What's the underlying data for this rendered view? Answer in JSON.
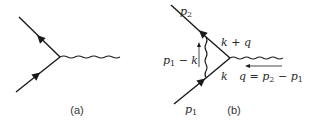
{
  "figure": {
    "panel_a": {
      "caption": "(a)",
      "description": "Tree-level vertex: incoming fermion, outgoing fermion, photon (wavy line)"
    },
    "panel_b": {
      "caption": "(b)",
      "labels": {
        "p2": {
          "base": "p",
          "sub": "2"
        },
        "p1": {
          "base": "p",
          "sub": "1"
        },
        "k_plus_q": "k + q",
        "k": "k",
        "p1_minus_k": {
          "base": "p",
          "sub": "1",
          "rest": " − k"
        },
        "q_def": {
          "lhs": "q = ",
          "a": "p",
          "a_sub": "2",
          "mid": " − ",
          "b": "p",
          "b_sub": "1"
        }
      },
      "description": "One-loop vertex correction with internal photon exchange"
    }
  }
}
